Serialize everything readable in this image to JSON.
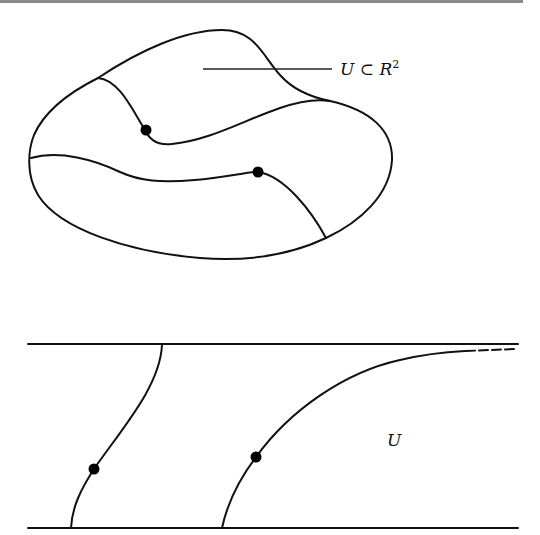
{
  "figure_top": {
    "label": "U ⊂ R",
    "label_sup": "2",
    "points": [
      {
        "name": "upper-point",
        "x": 146,
        "y": 130
      },
      {
        "name": "lower-point",
        "x": 258,
        "y": 172
      }
    ]
  },
  "figure_bottom": {
    "label": "U",
    "points": [
      {
        "name": "left-point",
        "x": 94,
        "y": 469
      },
      {
        "name": "right-point",
        "x": 256,
        "y": 457
      }
    ]
  },
  "colors": {
    "ink": "#111111",
    "rule": "#8a8a8a",
    "background": "#ffffff"
  }
}
